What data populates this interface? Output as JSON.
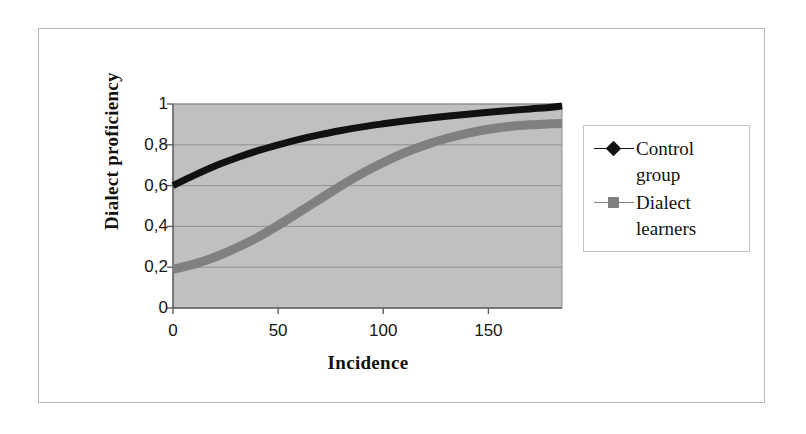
{
  "figure": {
    "background": "#ffffff",
    "frame_color": "#b9b9b9",
    "plot_background": "#c0c0c0",
    "gridline_color": "#8f8f8f",
    "axis_color": "#5f5f5f"
  },
  "axes": {
    "y_title": "Dialect  proficiency",
    "x_title": "Incidence",
    "y_tick_labels": [
      "0",
      "0,2",
      "0,4",
      "0,6",
      "0,8",
      "1"
    ],
    "x_tick_labels": [
      "0",
      "50",
      "100",
      "150"
    ]
  },
  "legend": {
    "position": "right",
    "entries": [
      {
        "label": "Control\ngroup",
        "color": "#111111",
        "marker": "diamond-marker"
      },
      {
        "label": "Dialect\nlearners",
        "color": "#808080",
        "marker": "square-marker"
      }
    ]
  },
  "chart_data": {
    "type": "line",
    "title": "",
    "subtitle": "",
    "xlabel": "Incidence",
    "ylabel": "Dialect proficiency",
    "xlim": [
      0,
      185
    ],
    "ylim": [
      0,
      1
    ],
    "xticks": [
      0,
      50,
      100,
      150
    ],
    "yticks": [
      0,
      0.2,
      0.4,
      0.6,
      0.8,
      1
    ],
    "grid": true,
    "legend_position": "right",
    "decimal_separator": ",",
    "x": [
      0,
      10,
      20,
      30,
      40,
      50,
      60,
      70,
      80,
      90,
      100,
      110,
      120,
      130,
      140,
      150,
      160,
      170,
      180,
      185
    ],
    "series": [
      {
        "name": "Control group",
        "color": "#111111",
        "marker": "diamond",
        "line_width": 7,
        "values": [
          0.6,
          0.65,
          0.696,
          0.735,
          0.77,
          0.8,
          0.827,
          0.85,
          0.87,
          0.888,
          0.903,
          0.917,
          0.929,
          0.94,
          0.95,
          0.959,
          0.968,
          0.976,
          0.984,
          0.99
        ]
      },
      {
        "name": "Dialect learners",
        "color": "#808080",
        "marker": "square",
        "line_width": 9,
        "values": [
          0.19,
          0.215,
          0.25,
          0.294,
          0.345,
          0.405,
          0.47,
          0.535,
          0.6,
          0.66,
          0.713,
          0.76,
          0.799,
          0.831,
          0.856,
          0.876,
          0.89,
          0.898,
          0.903,
          0.905
        ]
      }
    ]
  }
}
